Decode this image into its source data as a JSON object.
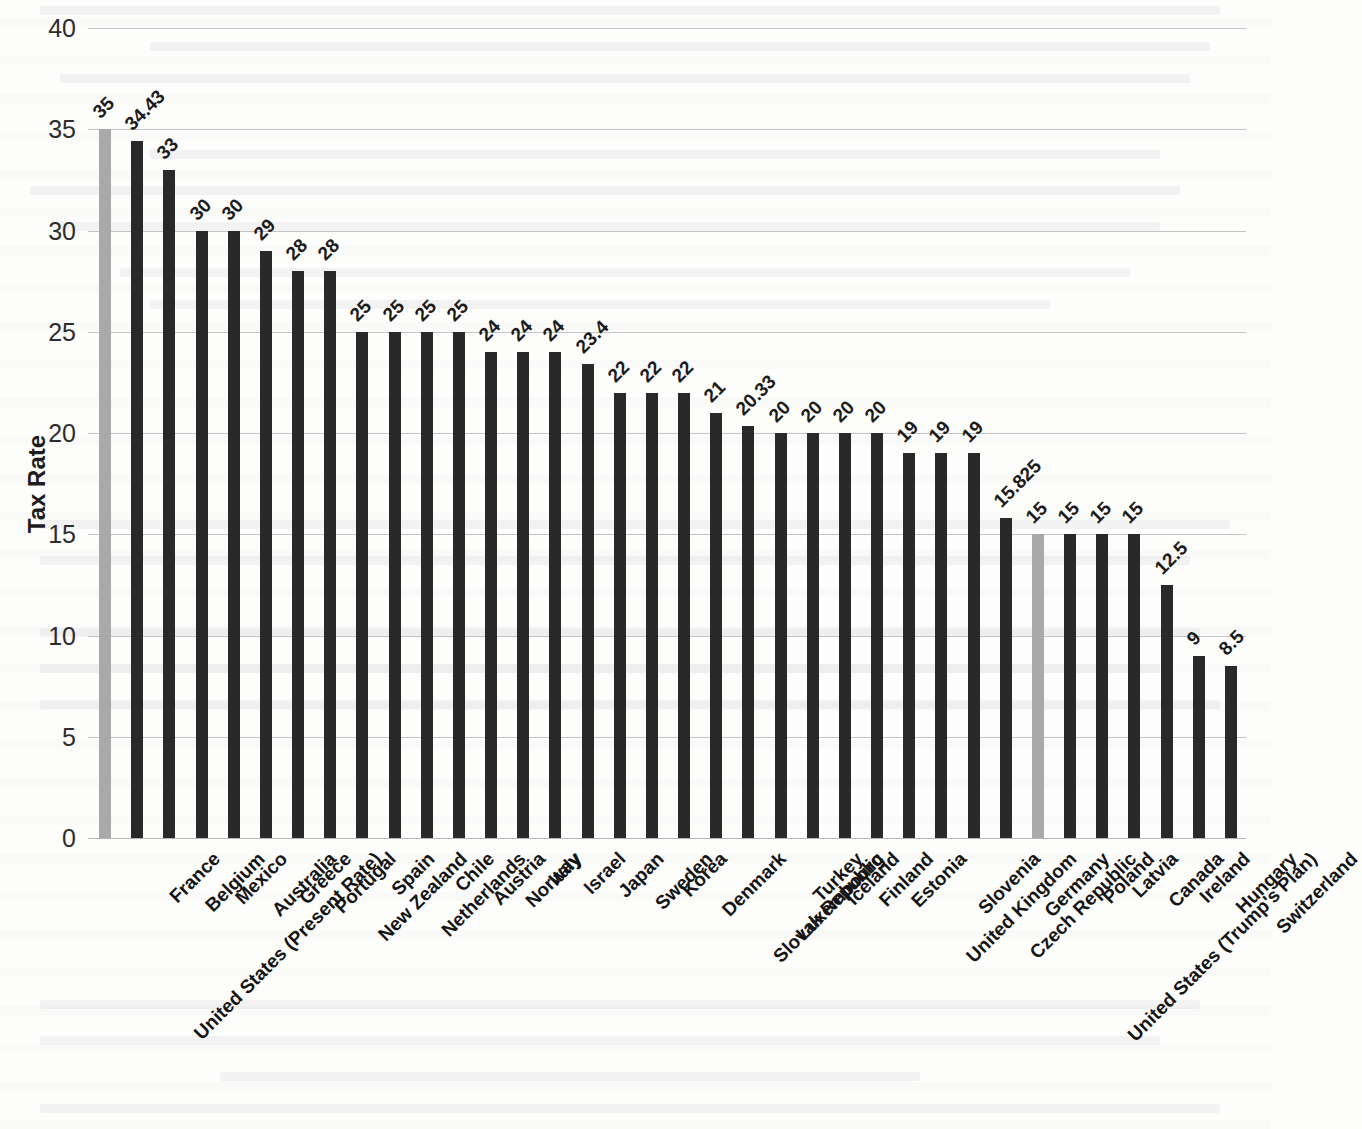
{
  "chart_data": {
    "type": "bar",
    "title": "",
    "subtitle": "",
    "xlabel": "",
    "ylabel": "Tax Rate",
    "ylim": [
      0,
      40
    ],
    "yticks": [
      0,
      5,
      10,
      15,
      20,
      25,
      30,
      35,
      40
    ],
    "ytick_labels": [
      "0",
      "5",
      "10",
      "15",
      "20",
      "25",
      "30",
      "35",
      "40"
    ],
    "grid": true,
    "legend": "none",
    "orientation": "vertical",
    "bar_colors": {
      "default": "#292929",
      "highlight": "#a9a9a9"
    },
    "categories": [
      "United States (Present Rate)",
      "France",
      "Belgium",
      "Mexico",
      "Australia",
      "Greece",
      "Portugal",
      "New Zealand",
      "Spain",
      "Netherlands",
      "Chile",
      "Austria",
      "Norway",
      "Italy",
      "Israel",
      "Japan",
      "Sweden",
      "Korea",
      "Denmark",
      "Slovak Republic",
      "Luxembourg",
      "Turkey",
      "Iceland",
      "Finland",
      "Estonia",
      "United Kingdom",
      "Slovenia",
      "Czech Republic",
      "Germany",
      "United States (Trump's Plan)",
      "Poland",
      "Latvia",
      "Canada",
      "Ireland",
      "Hungary",
      "Switzerland"
    ],
    "values": [
      35,
      34.43,
      33,
      30,
      30,
      29,
      28,
      28,
      25,
      25,
      25,
      25,
      24,
      24,
      24,
      23.4,
      22,
      22,
      22,
      21,
      20.33,
      20,
      20,
      20,
      20,
      19,
      19,
      19,
      15.825,
      15,
      15,
      15,
      15,
      12.5,
      9,
      8.5
    ],
    "value_labels": [
      "35",
      "34.43",
      "33",
      "30",
      "30",
      "29",
      "28",
      "28",
      "25",
      "25",
      "25",
      "25",
      "24",
      "24",
      "24",
      "23.4",
      "22",
      "22",
      "22",
      "21",
      "20.33",
      "20",
      "20",
      "20",
      "20",
      "19",
      "19",
      "19",
      "15.825",
      "15",
      "15",
      "15",
      "15",
      "12.5",
      "9",
      "8.5"
    ],
    "highlighted_indices": [
      0,
      29
    ]
  }
}
